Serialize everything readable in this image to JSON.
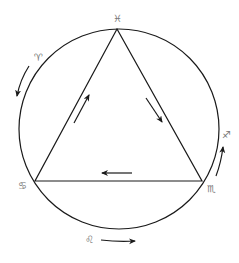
{
  "diagram": {
    "type": "zodiac-triplicity",
    "circle": {
      "cx": 119,
      "cy": 129,
      "r": 100
    },
    "triangle": {
      "vertices": [
        {
          "name": "top",
          "x": 117,
          "y": 29,
          "sign": "Pisces"
        },
        {
          "name": "left",
          "x": 35,
          "y": 181,
          "sign": "Cancer"
        },
        {
          "name": "right",
          "x": 202,
          "y": 181,
          "sign": "Scorpio"
        }
      ]
    },
    "labels": {
      "pisces": "♓",
      "aries": "♈",
      "cancer": "♋",
      "scorpio": "♏",
      "sagittarius": "♐",
      "leo": "♌"
    },
    "arrows": [
      {
        "name": "left-edge-arrow",
        "direction": "up-right"
      },
      {
        "name": "right-edge-arrow",
        "direction": "down-right"
      },
      {
        "name": "bottom-edge-arrow",
        "direction": "left"
      },
      {
        "name": "arc-aries-arrow",
        "direction": "counterclockwise-down"
      },
      {
        "name": "arc-sagittarius-arrow",
        "direction": "counterclockwise-up"
      },
      {
        "name": "arc-leo-arrow",
        "direction": "right"
      }
    ],
    "colors": {
      "stroke": "#1a1a1a",
      "label": "#777777"
    }
  }
}
